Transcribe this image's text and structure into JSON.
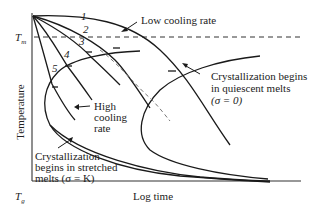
{
  "diagram": {
    "type": "CCT-style crystallization diagram",
    "axes": {
      "y_label": "Temperature",
      "x_label": "Log time",
      "y_markers": {
        "tm": "T",
        "tm_sub": "m",
        "tg": "T",
        "tg_sub": "g"
      }
    },
    "cooling_curves": [
      {
        "id": 1,
        "label": "1"
      },
      {
        "id": 2,
        "label": "2"
      },
      {
        "id": 3,
        "label": "3"
      },
      {
        "id": 4,
        "label": "4"
      },
      {
        "id": 5,
        "label": "5"
      }
    ],
    "annotations": {
      "low_cooling": "Low cooling rate",
      "high_cooling": [
        "High",
        "cooling",
        "rate"
      ],
      "quiescent": [
        "Crystallization begins",
        "in quiescent melts",
        "(σ = 0)"
      ],
      "stretched": [
        "Crystallization",
        "begins in stretched",
        "melts (σ = K)"
      ]
    },
    "colors": {
      "line": "#1a1a1a",
      "text": "#222222",
      "dashed_gray": "#777777"
    }
  }
}
